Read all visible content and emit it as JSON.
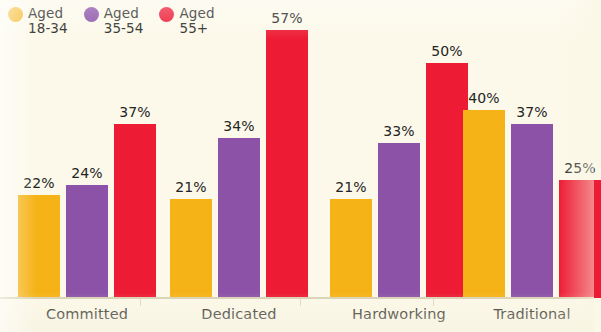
{
  "chart_data": {
    "type": "bar",
    "title": "",
    "xlabel": "",
    "ylabel": "",
    "ylim": [
      0,
      60
    ],
    "grid": false,
    "legend_position": "top-left",
    "categories": [
      "Committed",
      "Dedicated",
      "Hardworking",
      "Traditional"
    ],
    "series": [
      {
        "name": "Aged 18-34",
        "color": "#F5B318",
        "values": [
          22,
          21,
          21,
          40
        ],
        "labels": [
          "22%",
          "21%",
          "21%",
          "40%"
        ]
      },
      {
        "name": "Aged 35-54",
        "color": "#8B52A8",
        "values": [
          24,
          34,
          33,
          37
        ],
        "labels": [
          "24%",
          "34%",
          "33%",
          "37%"
        ]
      },
      {
        "name": "Aged 55+",
        "color": "#ED1B34",
        "values": [
          37,
          57,
          50,
          25
        ],
        "labels": [
          "37%",
          "57%",
          "50%",
          "25%"
        ]
      }
    ]
  },
  "legend": {
    "items": [
      {
        "label": "Aged\n18-34",
        "color": "#F5B318",
        "icon": "circle-marker-icon"
      },
      {
        "label": "Aged\n35-54",
        "color": "#8B52A8",
        "icon": "circle-marker-icon"
      },
      {
        "label": "Aged\n55+",
        "color": "#ED1B34",
        "icon": "circle-marker-icon"
      }
    ]
  },
  "colors": {
    "background": "#FCF9EA",
    "axis": "#D9D2B4",
    "text": "#242422",
    "series_18_34": "#F5B318",
    "series_35_54": "#8B52A8",
    "series_55_plus": "#ED1B34"
  },
  "layout": {
    "baseline_y": 297,
    "px_per_percent": 4.7,
    "bar_width": 42,
    "bar_gap": 6,
    "group_starts": [
      18,
      170,
      330,
      463
    ]
  }
}
